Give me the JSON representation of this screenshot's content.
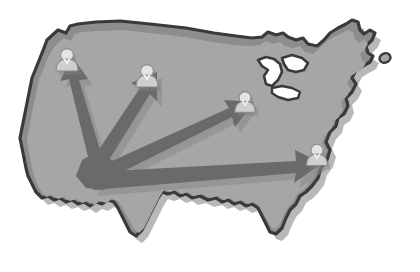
{
  "figure": {
    "title": "United States distribution map",
    "description": "Grayscale silhouette map of the contiguous United States with four user icons connected by arrows radiating from a single origin point in the western interior.",
    "canvas": {
      "width": 420,
      "height": 272
    },
    "background_color": "#ffffff"
  },
  "map": {
    "name": "contiguous-united-states",
    "outline_color": "#3a3a3a",
    "outline_width": 3.2,
    "border_band_color": "#8d8d8d",
    "fill_color": "#9d9d9d",
    "inner_fill_color": "#a6a6a6",
    "shadow_color": "#b8b8b8",
    "great_lakes_color": "#ffffff",
    "islands": [
      {
        "name": "northeast-island",
        "cx": 385,
        "cy": 58,
        "rx": 5.5,
        "ry": 4.5
      }
    ]
  },
  "origin": {
    "name": "distribution-origin",
    "label": "Origin hub",
    "x": 96,
    "y": 166
  },
  "arrows": {
    "color": "#6a6a6a",
    "shadow_color": "#8a8a8a",
    "count": 4,
    "items": [
      {
        "id": "arrow-northwest",
        "label": "Arrow to northwest node",
        "from_x": 96,
        "from_y": 166,
        "to_x": 67,
        "to_y": 62,
        "thickness": 13
      },
      {
        "id": "arrow-north",
        "label": "Arrow to north node",
        "from_x": 96,
        "from_y": 166,
        "to_x": 140,
        "to_y": 75,
        "thickness": 13
      },
      {
        "id": "arrow-northeast",
        "label": "Arrow to northeast node",
        "from_x": 96,
        "from_y": 166,
        "to_x": 243,
        "to_y": 104,
        "thickness": 14
      },
      {
        "id": "arrow-east",
        "label": "Arrow to east node",
        "from_x": 96,
        "from_y": 166,
        "to_x": 314,
        "to_y": 156,
        "thickness": 15
      }
    ]
  },
  "nodes": {
    "icon_name": "user-icon",
    "head_color": "#e4e4e4",
    "body_color": "#cfcfcf",
    "outline_color": "#8a8a8a",
    "count": 4,
    "items": [
      {
        "id": "node-northwest",
        "label": "User node 1",
        "x": 67,
        "y": 62,
        "scale": 1.0
      },
      {
        "id": "node-north",
        "label": "User node 2",
        "x": 147,
        "y": 78,
        "scale": 1.0
      },
      {
        "id": "node-northeast",
        "label": "User node 3",
        "x": 245,
        "y": 104,
        "scale": 0.92
      },
      {
        "id": "node-east",
        "label": "User node 4",
        "x": 317,
        "y": 157,
        "scale": 0.95
      }
    ]
  }
}
